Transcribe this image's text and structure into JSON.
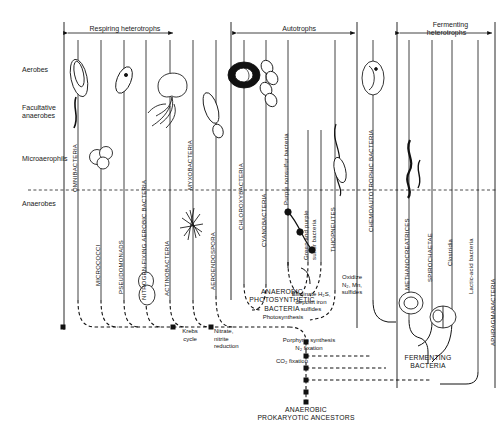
{
  "figure": {
    "title": "",
    "domain_kind": "phylogenetic chart of bacterial kingdoms"
  },
  "group_headers": [
    {
      "id": "respiring-heterotrophs",
      "label": "Respiring heterotrophs"
    },
    {
      "id": "autotrophs",
      "label": "Autotrophs"
    },
    {
      "id": "fermenting-heterotrophs",
      "label": "Fermenting\nheterotrophs"
    }
  ],
  "row_labels": [
    {
      "id": "aerobes",
      "label": "Aerobes"
    },
    {
      "id": "facultative-anaerobes",
      "label": "Facultative\nanaerobes"
    },
    {
      "id": "microaerophils",
      "label": "Microaerophils"
    },
    {
      "id": "anaerobes",
      "label": "Anaerobes"
    }
  ],
  "columns": [
    {
      "id": "omnibacteria",
      "label": "OMNIBACTERIA",
      "case": "upper"
    },
    {
      "id": "micrococci",
      "label": "MICROCOCCI",
      "case": "upper"
    },
    {
      "id": "pseudomonads",
      "label": "PSEUDOMONADS",
      "case": "upper"
    },
    {
      "id": "nitrogen-fixing-aerobic-bacteria",
      "label": "NITROGEN-FIXING AEROBIC BACTERIA",
      "case": "upper"
    },
    {
      "id": "actinobacteria",
      "label": "ACTINOBACTERIA",
      "case": "upper"
    },
    {
      "id": "myxobacteria",
      "label": "MYXOBACTERIA",
      "case": "upper"
    },
    {
      "id": "aeroendospora",
      "label": "AEROENDOSPORA",
      "case": "upper"
    },
    {
      "id": "chloroxybacteria",
      "label": "CHLOROXYBACTERIA",
      "case": "upper"
    },
    {
      "id": "cyanobacteria",
      "label": "CYANOBACTERIA",
      "case": "upper"
    },
    {
      "id": "purple-nonsulfur-bacteria",
      "label": "Purple nonsulfur bacteria",
      "case": "mixed"
    },
    {
      "id": "green-and-purple-sulfur-bacteria",
      "label": "Green and purple\nsulfur bacteria",
      "case": "mixed"
    },
    {
      "id": "thiopneutes",
      "label": "THIOPNEUTES",
      "case": "upper"
    },
    {
      "id": "chemoautotrophic-bacteria",
      "label": "CHEMOAUTOTROPHIC BACTERIA",
      "case": "upper"
    },
    {
      "id": "methanocreatrices",
      "label": "METHANOCREATRICES",
      "case": "upper"
    },
    {
      "id": "spirochaetae",
      "label": "SPIROCHAETAE",
      "case": "upper"
    },
    {
      "id": "clostridia",
      "label": "Clostridia",
      "case": "mixed"
    },
    {
      "id": "lactic-acid-bacteria",
      "label": "Lactic-acid bacteria",
      "case": "mixed"
    },
    {
      "id": "aphragmabacteria",
      "label": "APHRAGMABACTERIA",
      "case": "upper"
    }
  ],
  "annotations": [
    {
      "id": "anaerobic-photosynthetic-bacteria",
      "label": "ANAEROBIC\nPHOTOSYNTHETIC\nBACTERIA"
    },
    {
      "id": "photosynthesis",
      "label": "Photosynthesis"
    },
    {
      "id": "eliminate-sulfides",
      "label": "Eliminate H₂S,\ndeposit iron\nsulfides"
    },
    {
      "id": "oxidize",
      "label": "Oxidize\nN₂, Mn,\nsulfides"
    },
    {
      "id": "krebs-cycle",
      "label": "Krebs\ncycle"
    },
    {
      "id": "nitrate-nitrite-reduction",
      "label": "Nitrate,\nnitrite\nreduction"
    },
    {
      "id": "porphyrin-synthesis",
      "label": "Porphyrin synthesis"
    },
    {
      "id": "n2-fixation",
      "label": "N₂ fixation"
    },
    {
      "id": "co2-fixation",
      "label": "CO₂ fixation"
    },
    {
      "id": "fermenting-bacteria",
      "label": "FERMENTING\nBACTERIA"
    },
    {
      "id": "anaerobic-prokaryotic-ancestors",
      "label": "ANAEROBIC\nPROKARYOTIC ANCESTORS"
    }
  ],
  "colors": {
    "ink": "#111111",
    "background": "#ffffff",
    "rule": "#222222"
  }
}
